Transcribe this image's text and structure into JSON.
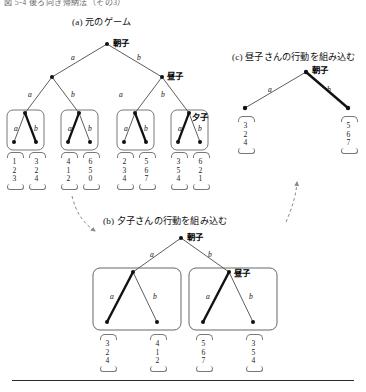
{
  "figure": {
    "header_clipped": "図 5-4  後ろ向き帰納法（その3）",
    "panels": {
      "a": {
        "caption": "(a) 元のゲーム"
      },
      "b": {
        "caption": "(b) 夕子さんの行動を組み込む"
      },
      "c": {
        "caption": "(c) 昼子さんの行動を組み込む"
      }
    },
    "players": {
      "asako": "朝子",
      "hiruko": "昼子",
      "yuko": "夕子"
    },
    "actions": {
      "a": "a",
      "b": "b"
    }
  },
  "chart_data": {
    "type": "diagram",
    "title": "図 5-4  後ろ向き帰納法（その3）",
    "subtype": "extensive-form-game-tree-backward-induction",
    "players": [
      "朝子",
      "昼子",
      "夕子"
    ],
    "action_labels": [
      "a",
      "b"
    ],
    "payoff_vector_order": [
      "朝子",
      "昼子",
      "夕子"
    ],
    "panels": [
      {
        "id": "a",
        "caption": "(a) 元のゲーム",
        "root_player": "朝子",
        "level2_player": "昼子",
        "level3_player": "夕子",
        "level3_boxes": 4,
        "leaves": [
          {
            "path": "a-a-a",
            "payoff": [
              1,
              2,
              3
            ],
            "bold": false
          },
          {
            "path": "a-a-b",
            "payoff": [
              3,
              2,
              4
            ],
            "bold": true
          },
          {
            "path": "a-b-a",
            "payoff": [
              4,
              1,
              2
            ],
            "bold": true
          },
          {
            "path": "a-b-b",
            "payoff": [
              6,
              5,
              0
            ],
            "bold": false
          },
          {
            "path": "b-a-a",
            "payoff": [
              2,
              3,
              4
            ],
            "bold": false
          },
          {
            "path": "b-a-b",
            "payoff": [
              5,
              6,
              7
            ],
            "bold": true
          },
          {
            "path": "b-b-a",
            "payoff": [
              3,
              5,
              4
            ],
            "bold": true
          },
          {
            "path": "b-b-b",
            "payoff": [
              6,
              2,
              1
            ],
            "bold": false
          }
        ]
      },
      {
        "id": "b",
        "caption": "(b) 夕子さんの行動を組み込む",
        "root_player": "朝子",
        "level2_player": "昼子",
        "level2_boxes": 2,
        "leaves": [
          {
            "path": "a-a",
            "payoff": [
              3,
              2,
              4
            ],
            "bold": true
          },
          {
            "path": "a-b",
            "payoff": [
              4,
              1,
              2
            ],
            "bold": false
          },
          {
            "path": "b-a",
            "payoff": [
              5,
              6,
              7
            ],
            "bold": true
          },
          {
            "path": "b-b",
            "payoff": [
              3,
              5,
              4
            ],
            "bold": false
          }
        ]
      },
      {
        "id": "c",
        "caption": "(c) 昼子さんの行動を組み込む",
        "root_player": "朝子",
        "leaves": [
          {
            "path": "a",
            "payoff": [
              3,
              2,
              4
            ],
            "bold": false
          },
          {
            "path": "b",
            "payoff": [
              5,
              6,
              7
            ],
            "bold": true
          }
        ]
      }
    ],
    "annotations": [
      {
        "type": "dashed-arrow",
        "from": "a",
        "to": "b"
      },
      {
        "type": "dashed-arrow",
        "from": "b",
        "to": "c"
      }
    ]
  }
}
